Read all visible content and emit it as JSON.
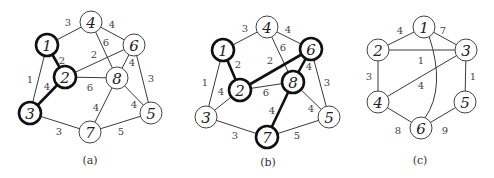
{
  "graphs": [
    {
      "id": "a",
      "caption": "(a)",
      "nodes": [
        {
          "id": "1",
          "x": 47,
          "y": 45,
          "bold": true
        },
        {
          "id": "2",
          "x": 65,
          "y": 77,
          "bold": true
        },
        {
          "id": "3",
          "x": 30,
          "y": 113,
          "bold": true
        },
        {
          "id": "4",
          "x": 91,
          "y": 22,
          "bold": false
        },
        {
          "id": "5",
          "x": 151,
          "y": 113,
          "bold": false
        },
        {
          "id": "6",
          "x": 134,
          "y": 45,
          "bold": false
        },
        {
          "id": "7",
          "x": 90,
          "y": 132,
          "bold": false
        },
        {
          "id": "8",
          "x": 117,
          "y": 78,
          "bold": false
        }
      ],
      "edges": [
        {
          "from": "1",
          "to": "4",
          "weight": "3",
          "bold": false,
          "lx": 68,
          "ly": 22
        },
        {
          "from": "4",
          "to": "6",
          "weight": "4",
          "bold": false,
          "lx": 112,
          "ly": 24
        },
        {
          "from": "4",
          "to": "8",
          "weight": "6",
          "bold": false,
          "lx": 106,
          "ly": 42
        },
        {
          "from": "1",
          "to": "2",
          "weight": "2",
          "bold": true,
          "lx": 62,
          "ly": 60
        },
        {
          "from": "2",
          "to": "6",
          "weight": "2",
          "bold": false,
          "lx": 94,
          "ly": 54
        },
        {
          "from": "1",
          "to": "3",
          "weight": "1",
          "bold": false,
          "lx": 30,
          "ly": 79
        },
        {
          "from": "2",
          "to": "3",
          "weight": "4",
          "bold": true,
          "lx": 47,
          "ly": 86
        },
        {
          "from": "2",
          "to": "8",
          "weight": "6",
          "bold": false,
          "lx": 90,
          "ly": 87
        },
        {
          "from": "6",
          "to": "8",
          "weight": "4",
          "bold": false,
          "lx": 132,
          "ly": 62
        },
        {
          "from": "6",
          "to": "5",
          "weight": "3",
          "bold": false,
          "lx": 151,
          "ly": 78
        },
        {
          "from": "8",
          "to": "5",
          "weight": "4",
          "bold": false,
          "lx": 134,
          "ly": 104
        },
        {
          "from": "8",
          "to": "7",
          "weight": "4",
          "bold": false,
          "lx": 96,
          "ly": 107
        },
        {
          "from": "3",
          "to": "7",
          "weight": "3",
          "bold": false,
          "lx": 59,
          "ly": 131
        },
        {
          "from": "7",
          "to": "5",
          "weight": "5",
          "bold": false,
          "lx": 121,
          "ly": 131
        }
      ],
      "caption_x": 90,
      "caption_y": 160
    },
    {
      "id": "b",
      "caption": "(b)",
      "nodes": [
        {
          "id": "1",
          "x": 223,
          "y": 50,
          "bold": true
        },
        {
          "id": "2",
          "x": 240,
          "y": 90,
          "bold": true
        },
        {
          "id": "3",
          "x": 206,
          "y": 117,
          "bold": false
        },
        {
          "id": "4",
          "x": 267,
          "y": 27,
          "bold": false
        },
        {
          "id": "5",
          "x": 329,
          "y": 117,
          "bold": false
        },
        {
          "id": "6",
          "x": 311,
          "y": 49,
          "bold": true
        },
        {
          "id": "7",
          "x": 267,
          "y": 137,
          "bold": true
        },
        {
          "id": "8",
          "x": 293,
          "y": 82,
          "bold": true
        }
      ],
      "edges": [
        {
          "from": "1",
          "to": "4",
          "weight": "3",
          "bold": false,
          "lx": 245,
          "ly": 28
        },
        {
          "from": "4",
          "to": "6",
          "weight": "4",
          "bold": false,
          "lx": 288,
          "ly": 29
        },
        {
          "from": "4",
          "to": "8",
          "weight": "6",
          "bold": false,
          "lx": 283,
          "ly": 47
        },
        {
          "from": "1",
          "to": "2",
          "weight": "2",
          "bold": true,
          "lx": 238,
          "ly": 64
        },
        {
          "from": "2",
          "to": "6",
          "weight": "2",
          "bold": true,
          "lx": 270,
          "ly": 60
        },
        {
          "from": "1",
          "to": "3",
          "weight": "1",
          "bold": false,
          "lx": 205,
          "ly": 82
        },
        {
          "from": "2",
          "to": "3",
          "weight": "4",
          "bold": false,
          "lx": 221,
          "ly": 91
        },
        {
          "from": "2",
          "to": "8",
          "weight": "6",
          "bold": false,
          "lx": 266,
          "ly": 92
        },
        {
          "from": "6",
          "to": "8",
          "weight": "4",
          "bold": true,
          "lx": 309,
          "ly": 66
        },
        {
          "from": "6",
          "to": "5",
          "weight": "3",
          "bold": false,
          "lx": 327,
          "ly": 82
        },
        {
          "from": "8",
          "to": "5",
          "weight": "4",
          "bold": false,
          "lx": 311,
          "ly": 108
        },
        {
          "from": "8",
          "to": "7",
          "weight": "4",
          "bold": true,
          "lx": 272,
          "ly": 110
        },
        {
          "from": "3",
          "to": "7",
          "weight": "3",
          "bold": false,
          "lx": 235,
          "ly": 135
        },
        {
          "from": "7",
          "to": "5",
          "weight": "5",
          "bold": false,
          "lx": 297,
          "ly": 135
        }
      ],
      "caption_x": 268,
      "caption_y": 162
    },
    {
      "id": "c",
      "caption": "(c)",
      "nodes": [
        {
          "id": "1",
          "x": 424,
          "y": 27,
          "bold": false
        },
        {
          "id": "2",
          "x": 378,
          "y": 50,
          "bold": false
        },
        {
          "id": "3",
          "x": 466,
          "y": 50,
          "bold": false
        },
        {
          "id": "4",
          "x": 378,
          "y": 102,
          "bold": false
        },
        {
          "id": "5",
          "x": 465,
          "y": 102,
          "bold": false
        },
        {
          "id": "6",
          "x": 421,
          "y": 128,
          "bold": false
        }
      ],
      "edges": [
        {
          "from": "1",
          "to": "2",
          "weight": "4",
          "bold": false,
          "lx": 400,
          "ly": 30
        },
        {
          "from": "1",
          "to": "3",
          "weight": "7",
          "bold": false,
          "lx": 443,
          "ly": 30
        },
        {
          "from": "2",
          "to": "3",
          "weight": "1",
          "bold": false,
          "lx": 421,
          "ly": 60
        },
        {
          "from": "2",
          "to": "4",
          "weight": "3",
          "bold": false,
          "lx": 369,
          "ly": 76
        },
        {
          "from": "3",
          "to": "4",
          "weight": "4",
          "bold": false,
          "lx": 421,
          "ly": 85
        },
        {
          "from": "3",
          "to": "5",
          "weight": "1",
          "bold": false,
          "lx": 473,
          "ly": 76
        },
        {
          "from": "4",
          "to": "6",
          "weight": "8",
          "bold": false,
          "lx": 398,
          "ly": 130
        },
        {
          "from": "5",
          "to": "6",
          "weight": "9",
          "bold": false,
          "lx": 445,
          "ly": 130
        },
        {
          "from": "1",
          "to": "6",
          "weight": "5",
          "bold": false,
          "curved": true,
          "lx": 421,
          "ly": 120
        }
      ],
      "caption_x": 420,
      "caption_y": 160
    }
  ]
}
